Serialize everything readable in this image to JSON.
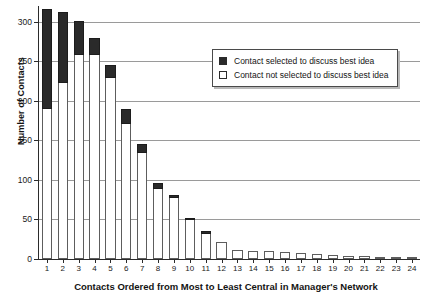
{
  "chart_data": {
    "type": "bar",
    "title": "",
    "subtitle": "",
    "xlabel": "Contacts Ordered from Most to Least Central in Manager's Network",
    "ylabel": "Number of Contacts",
    "ylim": [
      0,
      320
    ],
    "yticks": [
      0,
      50,
      100,
      150,
      200,
      250,
      300
    ],
    "ytick_labels": [
      "0",
      "50",
      "100",
      "150",
      "200",
      "250",
      "300"
    ],
    "grid": "horizontal",
    "stacked": true,
    "legend_position": "upper-right-inside",
    "categories": [
      "1",
      "2",
      "3",
      "4",
      "5",
      "6",
      "7",
      "8",
      "9",
      "10",
      "11",
      "12",
      "13",
      "14",
      "15",
      "16",
      "17",
      "18",
      "19",
      "20",
      "21",
      "22",
      "23",
      "24"
    ],
    "series": [
      {
        "name": "Contact not selected to discuss best idea",
        "color": "#ffffff",
        "values": [
          190,
          222,
          258,
          258,
          229,
          171,
          134,
          89,
          77,
          49,
          31,
          22,
          12,
          10,
          10,
          9,
          7,
          6,
          5,
          4,
          4,
          3,
          2,
          2
        ]
      },
      {
        "name": "Contact selected to discuss best idea",
        "color": "#2a2a2a",
        "values": [
          126,
          91,
          43,
          21,
          17,
          19,
          12,
          7,
          4,
          3,
          4,
          0,
          0,
          0,
          0,
          0,
          0,
          0,
          0,
          0,
          0,
          0,
          0,
          0
        ]
      }
    ],
    "totals": [
      316,
      313,
      301,
      279,
      246,
      190,
      146,
      96,
      81,
      52,
      35,
      22,
      12,
      10,
      10,
      9,
      7,
      6,
      5,
      4,
      4,
      3,
      2,
      2
    ]
  },
  "legend": {
    "items": [
      {
        "label": "Contact selected to discuss best idea",
        "swatch": "filled-square-icon"
      },
      {
        "label": "Contact not selected to discuss best idea",
        "swatch": "empty-square-icon"
      }
    ]
  }
}
